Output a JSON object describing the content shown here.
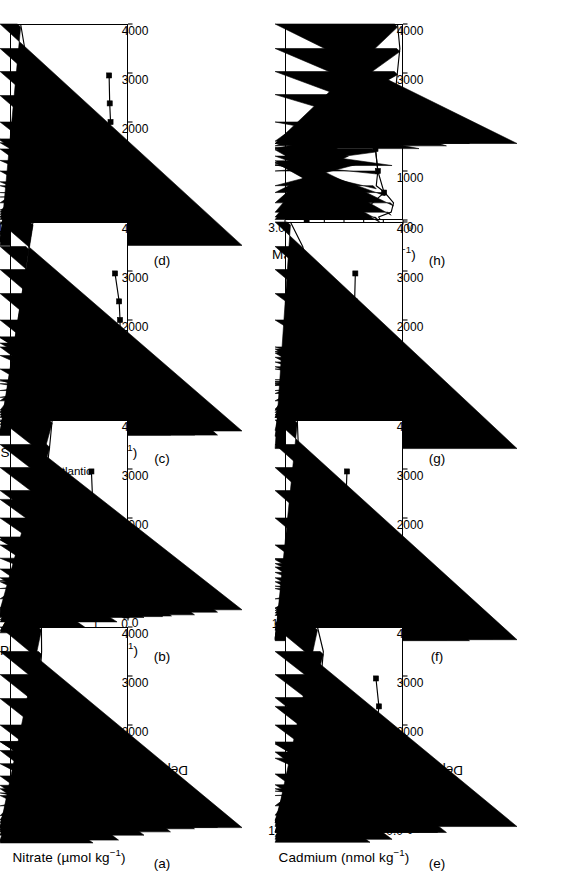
{
  "figure": {
    "axis_x_label": "Depth (m)",
    "series_labels": {
      "pacific": "Pacific",
      "atlantic": "Atlantic"
    },
    "marker_pacific": "filled-diamond",
    "marker_atlantic": "filled-square",
    "line_color": "#000000",
    "background": "#ffffff"
  },
  "chart_data": [
    {
      "id": "a",
      "panel_label": "(a)",
      "type": "line",
      "title": "",
      "ylabel": "Nitrate (µmol kg⁻¹)",
      "xlabel": "Depth (m)",
      "xlim": [
        0,
        4000
      ],
      "ylim": [
        0,
        50
      ],
      "xticks": [
        0,
        1000,
        2000,
        3000,
        4000
      ],
      "yticks": [
        0,
        10,
        20,
        30,
        40,
        50
      ],
      "grid": false,
      "legend": "none",
      "series": [
        {
          "name": "Pacific",
          "marker": "filled-diamond",
          "x": [
            10,
            60,
            150,
            350,
            560,
            700,
            770,
            960,
            1480,
            2000,
            2540,
            3030,
            3500,
            4000
          ],
          "values": [
            0.2,
            0.3,
            9.6,
            22.0,
            38.3,
            42.5,
            42.6,
            43.2,
            42.0,
            39.9,
            38.5,
            37.2,
            36.6,
            36.7
          ]
        }
      ]
    },
    {
      "id": "b",
      "panel_label": "(b)",
      "type": "line",
      "title": "",
      "ylabel": "Phosphate (µmol kg⁻¹)",
      "xlabel": "Depth (m)",
      "xlim": [
        0,
        4000
      ],
      "ylim": [
        0,
        4
      ],
      "xticks": [
        0,
        1000,
        2000,
        3000,
        4000
      ],
      "yticks": [
        0,
        1,
        2,
        3,
        4
      ],
      "grid": false,
      "legend": "inline-annotations",
      "annotations": [
        {
          "text": "Pacific",
          "x": 430,
          "y": 2.75
        },
        {
          "text": "Atlantic",
          "x": 2950,
          "y": 1.85
        }
      ],
      "series": [
        {
          "name": "Pacific",
          "marker": "filled-diamond",
          "x": [
            10,
            40,
            70,
            110,
            160,
            350,
            560,
            700,
            780,
            960,
            1450,
            2000,
            2380,
            2560,
            3030,
            3500,
            4000
          ],
          "values": [
            0.12,
            0.1,
            0.12,
            0.18,
            0.2,
            0.82,
            1.58,
            2.9,
            3.28,
            3.35,
            2.98,
            2.83,
            2.8,
            2.78,
            2.74,
            2.65,
            2.57
          ]
        },
        {
          "name": "Atlantic",
          "marker": "filled-square",
          "x": [
            10,
            50,
            110,
            350,
            560,
            700,
            1000,
            1450,
            2000,
            2380,
            2950
          ],
          "values": [
            0.05,
            0.06,
            0.07,
            0.18,
            0.55,
            0.78,
            1.37,
            1.19,
            1.18,
            1.2,
            1.24
          ]
        }
      ]
    },
    {
      "id": "c",
      "panel_label": "(c)",
      "type": "line",
      "title": "",
      "ylabel": "Silicic acid (µmol kg⁻¹)",
      "xlabel": "Depth (m)",
      "xlim": [
        0,
        4000
      ],
      "ylim": [
        0,
        200
      ],
      "xticks": [
        0,
        1000,
        2000,
        3000,
        4000
      ],
      "yticks": [
        0,
        50,
        100,
        150,
        200
      ],
      "grid": false,
      "legend": "none",
      "series": [
        {
          "name": "Pacific",
          "marker": "filled-diamond",
          "x": [
            10,
            60,
            110,
            160,
            350,
            560,
            700,
            780,
            1000,
            1450,
            2000,
            2540,
            3030,
            3500,
            4000
          ],
          "values": [
            1.5,
            2.0,
            3.0,
            12.0,
            33.0,
            76.0,
            104.0,
            129.0,
            150.0,
            164.0,
            167.0,
            168.0,
            168.0,
            168.0,
            161.0
          ]
        },
        {
          "name": "Atlantic",
          "marker": "filled-square",
          "x": [
            10,
            60,
            160,
            350,
            500,
            620,
            700,
            1000,
            1450,
            2000,
            2380,
            2950
          ],
          "values": [
            1.0,
            1.0,
            1.5,
            2.0,
            3.0,
            4.5,
            5.0,
            12.0,
            13.5,
            13.5,
            15.0,
            22.0
          ]
        }
      ]
    },
    {
      "id": "d",
      "panel_label": "(d)",
      "type": "line",
      "title": "",
      "ylabel": "Zinc (nmol kg⁻¹)",
      "xlabel": "Depth (m)",
      "xlim": [
        0,
        4000
      ],
      "ylim": [
        0,
        10
      ],
      "xticks": [
        0,
        1000,
        2000,
        3000,
        4000
      ],
      "yticks": [
        0,
        2,
        4,
        6,
        8,
        10
      ],
      "grid": false,
      "legend": "none",
      "series": [
        {
          "name": "Pacific",
          "marker": "filled-diamond",
          "x": [
            10,
            60,
            110,
            160,
            350,
            560,
            700,
            780,
            1000,
            1450,
            2000,
            2540,
            3030,
            3500,
            4000
          ],
          "values": [
            0.08,
            0.12,
            0.2,
            0.4,
            1.9,
            5.0,
            6.1,
            6.7,
            7.3,
            8.1,
            8.2,
            8.8,
            8.65,
            8.75,
            9.1
          ]
        },
        {
          "name": "Atlantic",
          "marker": "filled-square",
          "x": [
            10,
            60,
            160,
            350,
            560,
            700,
            1000,
            1450,
            2000,
            2380,
            2950
          ],
          "values": [
            0.05,
            0.08,
            0.1,
            0.25,
            0.5,
            1.3,
            1.8,
            2.0,
            1.48,
            1.55,
            1.6
          ]
        }
      ]
    },
    {
      "id": "e",
      "panel_label": "(e)",
      "type": "line",
      "title": "",
      "ylabel": "Cadmium (nmol kg⁻¹)",
      "xlabel": "Depth (m)",
      "xlim": [
        0,
        4000
      ],
      "ylim": [
        0,
        1.2
      ],
      "xticks": [
        0,
        1000,
        2000,
        3000,
        4000
      ],
      "yticks": [
        0.0,
        0.2,
        0.4,
        0.6,
        0.8,
        1.0,
        1.2
      ],
      "grid": false,
      "legend": "none",
      "series": [
        {
          "name": "Pacific",
          "marker": "filled-diamond",
          "x": [
            10,
            60,
            160,
            350,
            560,
            700,
            780,
            1000,
            1450,
            2000,
            2380,
            2560,
            3030,
            3500,
            4000
          ],
          "values": [
            0.01,
            0.02,
            0.03,
            0.175,
            0.51,
            0.82,
            0.97,
            1.03,
            1.0,
            0.925,
            0.93,
            0.93,
            0.83,
            0.81,
            0.87
          ]
        },
        {
          "name": "Atlantic",
          "marker": "filled-square",
          "x": [
            10,
            60,
            160,
            350,
            500,
            620,
            700,
            1000,
            1450,
            2000,
            2380,
            2950
          ],
          "values": [
            0.005,
            0.01,
            0.015,
            0.03,
            0.09,
            0.125,
            0.165,
            0.31,
            0.255,
            0.265,
            0.245,
            0.275
          ]
        }
      ]
    },
    {
      "id": "f",
      "panel_label": "(f)",
      "type": "line",
      "title": "",
      "ylabel": "Nickel (nmol kg⁻¹)",
      "xlabel": "Depth (m)",
      "xlim": [
        0,
        4000
      ],
      "ylim": [
        0,
        12
      ],
      "xticks": [
        0,
        1000,
        2000,
        3000,
        4000
      ],
      "yticks": [
        0,
        2,
        4,
        6,
        8,
        10,
        12
      ],
      "grid": false,
      "legend": "none",
      "series": [
        {
          "name": "Pacific",
          "marker": "filled-diamond",
          "x": [
            10,
            60,
            110,
            160,
            350,
            560,
            700,
            780,
            1000,
            1450,
            2000,
            2560,
            3030,
            3500,
            4000
          ],
          "values": [
            2.6,
            2.5,
            3.0,
            3.9,
            5.3,
            7.55,
            9.1,
            9.25,
            9.7,
            9.8,
            10.55,
            10.75,
            10.85,
            10.65,
            10.75
          ]
        },
        {
          "name": "Atlantic",
          "marker": "filled-square",
          "x": [
            10,
            60,
            160,
            350,
            700,
            1000,
            1450,
            2000,
            2380,
            2950
          ],
          "values": [
            2.0,
            2.0,
            2.0,
            2.9,
            3.0,
            4.35,
            5.65,
            5.5,
            5.8,
            5.7
          ]
        }
      ]
    },
    {
      "id": "g",
      "panel_label": "(g)",
      "type": "line",
      "title": "",
      "ylabel": "Copper (nmol kg⁻¹)",
      "xlabel": "Depth (m)",
      "xlim": [
        0,
        4000
      ],
      "ylim": [
        0,
        5
      ],
      "xticks": [
        0,
        1000,
        2000,
        3000,
        4000
      ],
      "yticks": [
        0,
        1,
        2,
        3,
        4,
        5
      ],
      "grid": false,
      "legend": "none",
      "series": [
        {
          "name": "Pacific",
          "marker": "filled-diamond",
          "x": [
            10,
            60,
            110,
            180,
            350,
            500,
            560,
            700,
            780,
            1000,
            1450,
            2000,
            2540,
            3030,
            3500,
            4000
          ],
          "values": [
            0.55,
            0.65,
            0.72,
            0.9,
            1.3,
            1.1,
            1.93,
            1.95,
            2.0,
            2.07,
            2.1,
            3.15,
            3.45,
            4.0,
            4.25,
            4.77
          ]
        },
        {
          "name": "Atlantic",
          "marker": "filled-square",
          "x": [
            10,
            110,
            350,
            560,
            700,
            1000,
            1450,
            2000,
            2380,
            2950
          ],
          "values": [
            1.08,
            1.22,
            1.3,
            1.12,
            1.3,
            1.52,
            1.65,
            1.72,
            2.05,
            2.02
          ]
        }
      ]
    },
    {
      "id": "h",
      "panel_label": "(h)",
      "type": "line",
      "title": "",
      "ylabel": "Manganese (nmol kg⁻¹)",
      "xlabel": "Depth (m)",
      "xlim": [
        0,
        4000
      ],
      "ylim": [
        0.0,
        3.0
      ],
      "xticks": [
        0,
        1000,
        2000,
        3000,
        4000
      ],
      "yticks": [
        0.0,
        0.5,
        1.0,
        1.5,
        2.0,
        2.5,
        3.0
      ],
      "grid": false,
      "legend": "none",
      "series": [
        {
          "name": "Pacific",
          "marker": "filled-diamond",
          "x": [
            10,
            60,
            160,
            350,
            560,
            700,
            1000,
            1450,
            2000,
            2560,
            3030,
            3500,
            4000
          ],
          "values": [
            0.58,
            0.62,
            0.3,
            0.24,
            0.46,
            0.68,
            0.64,
            0.7,
            0.27,
            0.2,
            0.14,
            0.08,
            0.14
          ]
        },
        {
          "name": "Atlantic",
          "marker": "filled-square",
          "x": [
            10,
            60,
            560,
            1000,
            1450,
            2950
          ],
          "values": [
            2.45,
            1.18,
            0.48,
            0.64,
            0.7,
            0.44
          ]
        }
      ]
    }
  ]
}
